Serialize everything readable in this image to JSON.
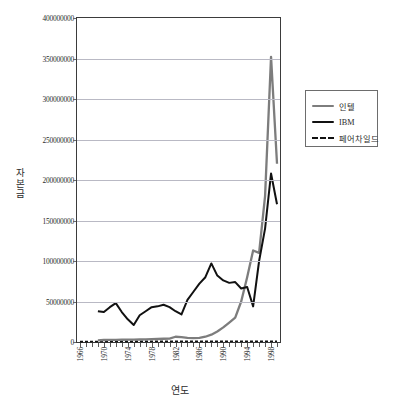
{
  "chart_title": "",
  "axes": {
    "y_title": "자본금",
    "x_title": "연도",
    "y_ticks": [
      "0",
      "50000000",
      "100000000",
      "150000000",
      "200000000",
      "250000000",
      "300000000",
      "350000000",
      "400000000"
    ],
    "x_ticks": [
      "1966",
      "1970",
      "1974",
      "1978",
      "1982",
      "1986",
      "1990",
      "1994",
      "1998"
    ]
  },
  "legend": {
    "items": [
      {
        "label": "인텔",
        "color": "#7d7d7d",
        "style": "solid"
      },
      {
        "label": "IBM",
        "color": "#111111",
        "style": "solid"
      },
      {
        "label": "페어차일드",
        "color": "#111111",
        "style": "dashed"
      }
    ]
  },
  "chart_data": {
    "type": "line",
    "title": "",
    "xlabel": "연도",
    "ylabel": "자본금",
    "ylim": [
      0,
      400000000
    ],
    "ytick_step": 50000000,
    "grid": true,
    "legend_position": "right",
    "categories": [
      1966,
      1967,
      1968,
      1969,
      1970,
      1971,
      1972,
      1973,
      1974,
      1975,
      1976,
      1977,
      1978,
      1979,
      1980,
      1981,
      1982,
      1983,
      1984,
      1985,
      1986,
      1987,
      1988,
      1989,
      1990,
      1991,
      1992,
      1993,
      1994,
      1995,
      1996,
      1997,
      1998,
      1999
    ],
    "series": [
      {
        "name": "인텔",
        "color": "#7d7d7d",
        "style": "solid",
        "values": [
          null,
          null,
          null,
          2000000,
          2500000,
          2600000,
          2700000,
          2800000,
          2900000,
          3000000,
          3100000,
          3300000,
          3500000,
          3700000,
          4000000,
          4200000,
          6500000,
          6000000,
          5200000,
          4800000,
          5000000,
          6500000,
          9000000,
          13000000,
          18000000,
          24000000,
          30000000,
          50000000,
          80000000,
          113000000,
          110000000,
          180000000,
          352000000,
          220000000
        ]
      },
      {
        "name": "IBM",
        "color": "#111111",
        "style": "solid",
        "values": [
          null,
          null,
          null,
          38000000,
          37000000,
          43000000,
          48000000,
          37000000,
          28000000,
          21000000,
          33000000,
          38000000,
          43000000,
          44000000,
          46000000,
          43000000,
          38000000,
          34000000,
          52000000,
          62000000,
          72000000,
          80000000,
          97000000,
          82000000,
          76000000,
          73000000,
          74000000,
          66000000,
          68000000,
          44000000,
          31000000,
          30000000,
          36000000,
          55000000
        ]
      },
      {
        "name": "페어차일드",
        "color": "#111111",
        "style": "dashed",
        "values": [
          500000,
          500000,
          600000,
          600000,
          700000,
          700000,
          700000,
          800000,
          800000,
          800000,
          900000,
          900000,
          900000,
          1000000,
          1000000,
          1000000,
          1000000,
          1000000,
          1000000,
          1000000,
          1000000,
          1000000,
          1000000,
          1000000,
          1000000,
          1000000,
          1000000,
          1000000,
          1000000,
          1000000,
          1000000,
          1000000,
          1000000,
          1000000
        ]
      }
    ],
    "series_ibm_late": {
      "note": "IBM continues upward steeply after 1995",
      "values_override": [
        null,
        null,
        null,
        null,
        null,
        null,
        null,
        null,
        null,
        null,
        null,
        null,
        null,
        null,
        null,
        null,
        null,
        null,
        null,
        null,
        null,
        null,
        null,
        null,
        null,
        null,
        null,
        null,
        null,
        null,
        100000000,
        140000000,
        208000000,
        170000000
      ]
    }
  }
}
